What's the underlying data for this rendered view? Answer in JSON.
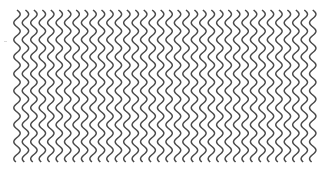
{
  "pattern": {
    "type": "wavy-vertical-lines",
    "line_count": 36,
    "x_start": 17,
    "x_pitch": 8.45,
    "y_start": 10,
    "y_end": 162,
    "wave_period": 17,
    "wave_amplitude": 3.2,
    "stroke_color": "#4a4a4a",
    "stroke_width": 1.5,
    "background": "#ffffff"
  }
}
